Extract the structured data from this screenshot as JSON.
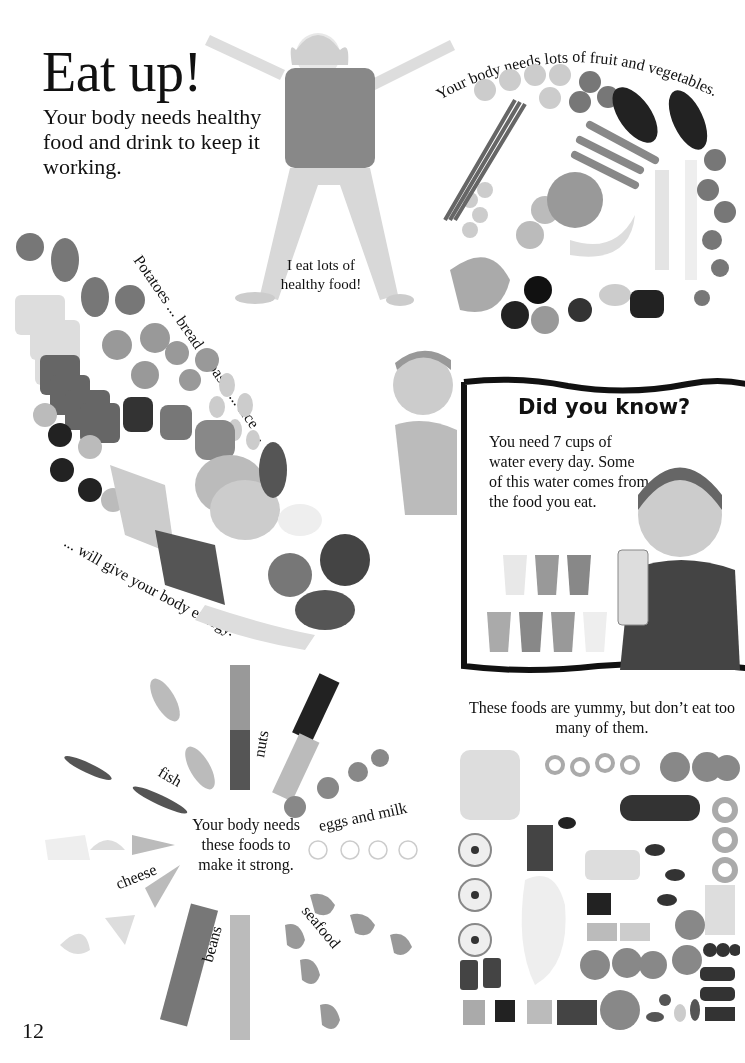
{
  "page": {
    "title": "Eat up!",
    "intro": "Your body needs healthy food and drink to keep it working.",
    "page_number": "12"
  },
  "girl_photo": {
    "speech": "I eat lots of healthy food!"
  },
  "fruit_veg": {
    "caption": "Your body needs lots of fruit and vegetables."
  },
  "starches": {
    "caption_top": "Potatoes ... bread ... pasta ... rice ...",
    "caption_bottom": "... will give your body energy."
  },
  "did_you_know": {
    "title": "Did you know?",
    "text": "You need 7 cups of water every day. Some of this water comes from the food you eat.",
    "cups_count": 7
  },
  "strong_foods": {
    "center_text": "Your body needs these foods to make it strong.",
    "labels": {
      "fish": "fish",
      "nuts": "nuts",
      "eggs_milk": "eggs and milk",
      "cheese": "cheese",
      "beans": "beans",
      "seafood": "seafood"
    }
  },
  "treats": {
    "caption": "These foods are yummy, but don’t eat too many of them."
  }
}
